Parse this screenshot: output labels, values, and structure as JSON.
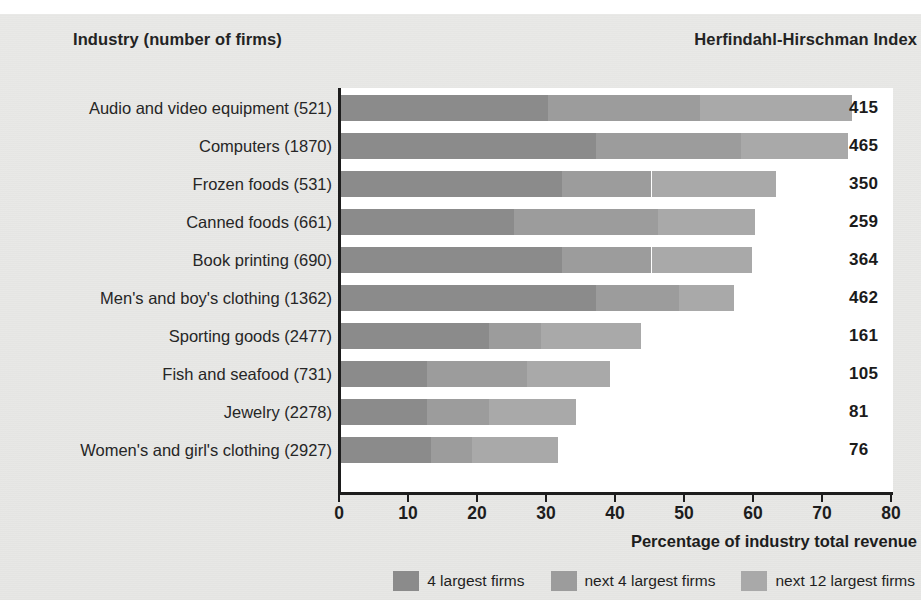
{
  "header": {
    "industry_title": "Industry (number of firms)",
    "hhi_title": "Herfindahl-Hirschman Index"
  },
  "axis": {
    "xlabel": "Percentage of industry total revenue",
    "ticks": [
      "0",
      "10",
      "20",
      "30",
      "40",
      "50",
      "60",
      "70",
      "80"
    ]
  },
  "legend": {
    "items": [
      {
        "label": "4 largest firms",
        "color": "#8b8b8b"
      },
      {
        "label": "next 4 largest firms",
        "color": "#9c9c9c"
      },
      {
        "label": "next 12 largest firms",
        "color": "#a9a9a9"
      }
    ]
  },
  "chart_data": {
    "type": "bar",
    "orientation": "horizontal",
    "stacked": true,
    "title": "",
    "xlabel": "Percentage of industry total revenue",
    "ylabel": "Industry (number of firms)",
    "xlim": [
      0,
      80
    ],
    "grid": false,
    "legend_position": "bottom-right",
    "series": [
      {
        "name": "4 largest firms",
        "color": "#8b8b8b",
        "values": [
          30,
          37,
          32,
          25,
          32,
          37,
          21.5,
          12.5,
          12.5,
          13
        ]
      },
      {
        "name": "next 4 largest firms",
        "color": "#9c9c9c",
        "values": [
          22,
          21,
          13,
          21,
          13,
          12,
          7.5,
          14.5,
          9,
          6
        ]
      },
      {
        "name": "next 12 largest firms",
        "color": "#a9a9a9",
        "values": [
          22,
          15.5,
          18,
          14,
          14.5,
          8,
          14.5,
          12,
          12.5,
          12.5
        ]
      }
    ],
    "categories": [
      "Audio and video equipment  (521)",
      "Computers  (1870)",
      "Frozen foods  (531)",
      "Canned foods  (661)",
      "Book printing  (690)",
      "Men's and boy's clothing  (1362)",
      "Sporting goods  (2477)",
      "Fish and seafood  (731)",
      "Jewelry  (2278)",
      "Women's and girl's clothing  (2927)"
    ],
    "annotations": {
      "name": "Herfindahl-Hirschman Index",
      "values": [
        "415",
        "465",
        "350",
        "259",
        "364",
        "462",
        "161",
        "105",
        "81",
        "76"
      ]
    }
  },
  "rows": [
    {
      "label": "Audio and video equipment  (521)",
      "s1": 30,
      "s2": 22,
      "s3": 22,
      "hhi": "415"
    },
    {
      "label": "Computers  (1870)",
      "s1": 37,
      "s2": 21,
      "s3": 15.5,
      "hhi": "465"
    },
    {
      "label": "Frozen foods  (531)",
      "s1": 32,
      "s2": 13,
      "s3": 18,
      "hhi": "350"
    },
    {
      "label": "Canned foods  (661)",
      "s1": 25,
      "s2": 21,
      "s3": 14,
      "hhi": "259"
    },
    {
      "label": "Book printing  (690)",
      "s1": 32,
      "s2": 13,
      "s3": 14.5,
      "hhi": "364"
    },
    {
      "label": "Men's and boy's clothing  (1362)",
      "s1": 37,
      "s2": 12,
      "s3": 8,
      "hhi": "462"
    },
    {
      "label": "Sporting goods  (2477)",
      "s1": 21.5,
      "s2": 7.5,
      "s3": 14.5,
      "hhi": "161"
    },
    {
      "label": "Fish and seafood  (731)",
      "s1": 12.5,
      "s2": 14.5,
      "s3": 12,
      "hhi": "105"
    },
    {
      "label": "Jewelry  (2278)",
      "s1": 12.5,
      "s2": 9,
      "s3": 12.5,
      "hhi": "81"
    },
    {
      "label": "Women's and girl's clothing  (2927)",
      "s1": 13,
      "s2": 6,
      "s3": 12.5,
      "hhi": "76"
    }
  ]
}
